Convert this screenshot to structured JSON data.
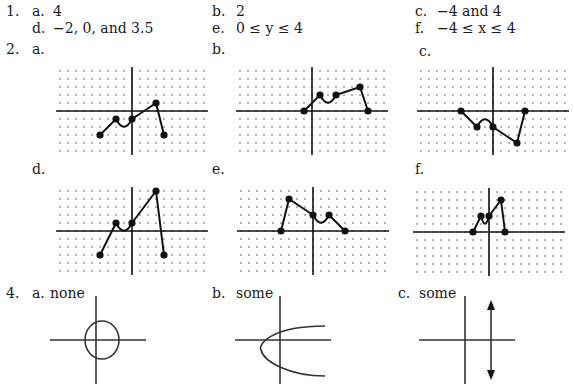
{
  "problem1": {
    "number": "1.",
    "answers": [
      {
        "label": "a.",
        "value": "4"
      },
      {
        "label": "b.",
        "value": "2"
      },
      {
        "label": "c.",
        "value": "−4 and 4"
      },
      {
        "label": "d.",
        "value": "−2, 0, and 3.5"
      },
      {
        "label": "e.",
        "value": "0 ≤ y ≤ 4"
      },
      {
        "label": "f.",
        "value": "−4 ≤ x ≤ 4"
      }
    ]
  },
  "problem2": {
    "number": "2.",
    "graphs": [
      {
        "label": "a.",
        "points": [
          [
            -4,
            -3
          ],
          [
            -2,
            -1
          ],
          [
            0,
            -1
          ],
          [
            3,
            1
          ],
          [
            4,
            -3
          ]
        ],
        "dip_between": [
          1,
          2
        ]
      },
      {
        "label": "b.",
        "points": [
          [
            -1,
            0
          ],
          [
            1,
            2
          ],
          [
            3,
            2
          ],
          [
            6,
            3
          ],
          [
            7,
            0
          ]
        ],
        "dip_between": [
          1,
          2
        ]
      },
      {
        "label": "c.",
        "points": [
          [
            -4,
            0
          ],
          [
            -2,
            -2
          ],
          [
            0,
            -2
          ],
          [
            3,
            -4
          ],
          [
            4,
            0
          ]
        ],
        "bump_between": [
          1,
          2
        ]
      },
      {
        "label": "d.",
        "points": [
          [
            -4,
            -3
          ],
          [
            -2,
            1
          ],
          [
            0,
            1
          ],
          [
            3,
            5
          ],
          [
            4,
            -3
          ]
        ],
        "dip_between": [
          1,
          2
        ]
      },
      {
        "label": "e.",
        "points": [
          [
            -4,
            0
          ],
          [
            -3,
            4
          ],
          [
            0,
            2
          ],
          [
            2,
            2
          ],
          [
            4,
            0
          ]
        ],
        "dip_between": [
          2,
          3
        ]
      },
      {
        "label": "f.",
        "points": [
          [
            -2,
            0
          ],
          [
            -1,
            2
          ],
          [
            0,
            2
          ],
          [
            1.5,
            4
          ],
          [
            2,
            0
          ]
        ],
        "dip_between": [
          1,
          2
        ]
      }
    ]
  },
  "problem4": {
    "number": "4.",
    "answers": [
      {
        "label": "a.",
        "value": "none",
        "sketch": "circle"
      },
      {
        "label": "b.",
        "value": "some",
        "sketch": "sideways-parabola"
      },
      {
        "label": "c.",
        "value": "some",
        "sketch": "vertical-line"
      }
    ]
  }
}
